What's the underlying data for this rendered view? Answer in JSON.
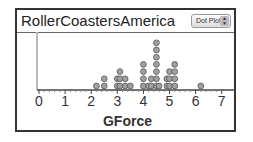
{
  "header": {
    "title": "RollerCoastersAmerica",
    "plot_type_select": "Dot Plot"
  },
  "axis": {
    "label": "GForce",
    "ticks": [
      "0",
      "1",
      "2",
      "3",
      "4",
      "5",
      "6",
      "7"
    ]
  },
  "colors": {
    "dot_fill": "#a0a0a0",
    "dot_stroke": "#555555",
    "frame": "#333333"
  },
  "chart_data": {
    "type": "scatter",
    "subtype": "dot_plot",
    "title": "RollerCoastersAmerica",
    "xlabel": "GForce",
    "ylabel": "",
    "xlim": [
      0,
      7.4
    ],
    "x_ticks": [
      0,
      1,
      2,
      3,
      4,
      5,
      6,
      7
    ],
    "grid": false,
    "legend": null,
    "stacks": [
      {
        "x": 2.2,
        "count": 1
      },
      {
        "x": 2.5,
        "count": 2
      },
      {
        "x": 3.0,
        "count": 2
      },
      {
        "x": 3.1,
        "count": 3
      },
      {
        "x": 3.3,
        "count": 2
      },
      {
        "x": 3.5,
        "count": 1
      },
      {
        "x": 4.0,
        "count": 4
      },
      {
        "x": 4.2,
        "count": 1
      },
      {
        "x": 4.3,
        "count": 2
      },
      {
        "x": 4.5,
        "count": 7
      },
      {
        "x": 4.6,
        "count": 1
      },
      {
        "x": 4.9,
        "count": 2
      },
      {
        "x": 5.0,
        "count": 3
      },
      {
        "x": 5.2,
        "count": 4
      },
      {
        "x": 6.2,
        "count": 1
      }
    ]
  }
}
